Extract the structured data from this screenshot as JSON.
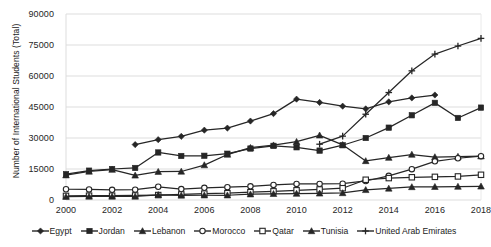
{
  "axes": {
    "ylabel": "Number of International Students (Total)",
    "yticks": [
      "0",
      "15000",
      "30000",
      "45000",
      "60000",
      "75000",
      "90000"
    ],
    "ylim": [
      0,
      90000
    ],
    "xticks": [
      "2000",
      "2002",
      "2004",
      "2006",
      "2008",
      "2010",
      "2012",
      "2014",
      "2016",
      "2018"
    ],
    "xlim": [
      2000,
      2018
    ],
    "grid": true
  },
  "legend": {
    "position": "bottom",
    "items": [
      {
        "label": "Egypt",
        "marker": "diamond-filled",
        "color": "#262626"
      },
      {
        "label": "Jordan",
        "marker": "square-filled",
        "color": "#262626"
      },
      {
        "label": "Lebanon",
        "marker": "triangle-filled",
        "color": "#262626"
      },
      {
        "label": "Morocco",
        "marker": "circle-open",
        "color": "#262626"
      },
      {
        "label": "Qatar",
        "marker": "square-open",
        "color": "#262626"
      },
      {
        "label": "Tunisia",
        "marker": "triangle-filled",
        "color": "#262626"
      },
      {
        "label": "United Arab Emirates",
        "marker": "plus",
        "color": "#262626"
      }
    ]
  },
  "chart_data": {
    "type": "line",
    "title": "",
    "xlabel": "",
    "ylabel": "Number of International Students (Total)",
    "xlim": [
      2000,
      2018
    ],
    "ylim": [
      0,
      90000
    ],
    "grid": true,
    "legend_position": "bottom",
    "x": [
      2000,
      2001,
      2002,
      2003,
      2004,
      2005,
      2006,
      2007,
      2008,
      2009,
      2010,
      2011,
      2012,
      2013,
      2014,
      2015,
      2016,
      2017,
      2018
    ],
    "series": [
      {
        "name": "Egypt",
        "marker": "diamond-filled",
        "color": "#262626",
        "values": [
          null,
          null,
          null,
          26800,
          29200,
          30800,
          33800,
          34800,
          38200,
          41800,
          48800,
          47200,
          45400,
          44100,
          47500,
          49400,
          50800,
          null,
          null
        ]
      },
      {
        "name": "Jordan",
        "marker": "square-filled",
        "color": "#262626",
        "values": [
          12500,
          14200,
          15000,
          15500,
          23000,
          21300,
          21400,
          22400,
          24900,
          26200,
          25500,
          23900,
          26500,
          30000,
          35000,
          41000,
          47000,
          39700,
          44700
        ]
      },
      {
        "name": "Lebanon",
        "marker": "triangle-filled",
        "color": "#262626",
        "values": [
          12000,
          13800,
          14700,
          11900,
          13700,
          13800,
          16900,
          22000,
          25300,
          26500,
          28200,
          31300,
          26700,
          18900,
          20500,
          22000,
          20800,
          21000,
          21200
        ]
      },
      {
        "name": "Morocco",
        "marker": "circle-open",
        "color": "#262626",
        "values": [
          5200,
          5100,
          4900,
          5000,
          6400,
          5300,
          5900,
          6200,
          6600,
          7300,
          7800,
          7800,
          7900,
          9200,
          11700,
          14900,
          18700,
          20200,
          21200
        ]
      },
      {
        "name": "Qatar",
        "marker": "square-open",
        "color": "#262626",
        "values": [
          2000,
          2100,
          2100,
          2200,
          2400,
          2700,
          3100,
          3300,
          3800,
          4200,
          4700,
          5100,
          5700,
          9800,
          10600,
          11000,
          11200,
          11400,
          12200
        ]
      },
      {
        "name": "Tunisia",
        "marker": "triangle-filled",
        "color": "#262626",
        "values": [
          1600,
          1700,
          1700,
          1700,
          2500,
          2200,
          2300,
          2300,
          2800,
          3000,
          3100,
          3200,
          3400,
          4900,
          5600,
          6300,
          6400,
          6500,
          6600
        ]
      },
      {
        "name": "United Arab Emirates",
        "marker": "plus",
        "color": "#262626",
        "values": [
          null,
          null,
          null,
          null,
          null,
          null,
          null,
          null,
          null,
          null,
          null,
          27000,
          30900,
          41500,
          52000,
          62500,
          70600,
          74500,
          78200
        ]
      }
    ]
  }
}
